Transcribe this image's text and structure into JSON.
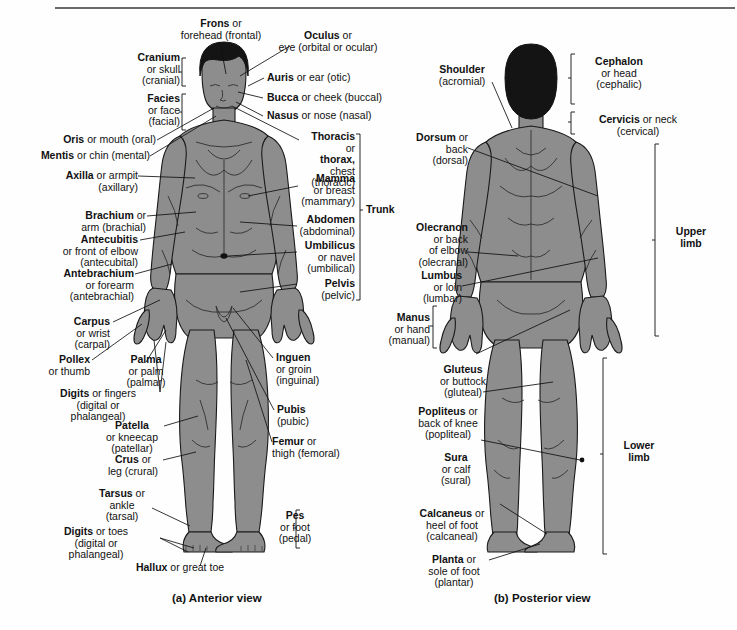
{
  "figure": {
    "caption_a": "(a) Anterior view",
    "caption_b": "(b) Posterior view",
    "body_color": "#8d8d8d",
    "hair_color": "#141414",
    "outline_color": "#1a1a1a",
    "background_color": "#fefefe"
  },
  "anterior": {
    "labels": [
      {
        "id": "frons",
        "term": "Frons",
        "rest": " or\nforehead (frontal)"
      },
      {
        "id": "oculus",
        "term": "Oculus",
        "rest": " or\neye (orbital or ocular)"
      },
      {
        "id": "cranium",
        "term": "Cranium",
        "rest": "\nor skull\n(cranial)"
      },
      {
        "id": "auris",
        "term": "Auris",
        "rest": " or ear (otic)"
      },
      {
        "id": "facies",
        "term": "Facies",
        "rest": "\nor face\n(facial)"
      },
      {
        "id": "bucca",
        "term": "Bucca",
        "rest": " or cheek (buccal)"
      },
      {
        "id": "nasus",
        "term": "Nasus",
        "rest": " or nose (nasal)"
      },
      {
        "id": "oris",
        "term": "Oris",
        "rest": " or mouth (oral)"
      },
      {
        "id": "thoracis",
        "term": "Thoracis",
        "rest": " or\nthorax, chest\n(thoracic)",
        "term2": "thorax,"
      },
      {
        "id": "mentis",
        "term": "Mentis",
        "rest": " or chin (mental)"
      },
      {
        "id": "mamma",
        "term": "Mamma",
        "rest": "\nor breast\n(mammary)"
      },
      {
        "id": "axilla",
        "term": "Axilla",
        "rest": " or armpit\n(axillary)"
      },
      {
        "id": "abdomen",
        "term": "Abdomen",
        "rest": "\n(abdominal)"
      },
      {
        "id": "brachium",
        "term": "Brachium",
        "rest": " or\narm (brachial)"
      },
      {
        "id": "umbilicus",
        "term": "Umbilicus",
        "rest": "\nor navel\n(umbilical)"
      },
      {
        "id": "antecubitis",
        "term": "Antecubitis",
        "rest": "\nor front of elbow\n(antecubital)"
      },
      {
        "id": "pelvis",
        "term": "Pelvis",
        "rest": "\n(pelvic)"
      },
      {
        "id": "antebrachium",
        "term": "Antebrachium",
        "rest": "\nor forearm\n(antebrachial)"
      },
      {
        "id": "carpus",
        "term": "Carpus",
        "rest": "\nor wrist\n(carpal)"
      },
      {
        "id": "pollex",
        "term": "Pollex",
        "rest": "\nor thumb"
      },
      {
        "id": "palma",
        "term": "Palma",
        "rest": "\nor palm\n(palmar)"
      },
      {
        "id": "digits_hand",
        "term": "Digits",
        "rest": " or fingers\n(digital or\nphalangeal)"
      },
      {
        "id": "inguen",
        "term": "Inguen",
        "rest": "\nor groin\n(inguinal)"
      },
      {
        "id": "pubis",
        "term": "Pubis",
        "rest": "\n(pubic)"
      },
      {
        "id": "patella",
        "term": "Patella",
        "rest": "\nor kneecap\n(patellar)"
      },
      {
        "id": "femur",
        "term": "Femur",
        "rest": " or\nthigh (femoral)"
      },
      {
        "id": "crus",
        "term": "Crus",
        "rest": " or\nleg (crural)"
      },
      {
        "id": "tarsus",
        "term": "Tarsus",
        "rest": " or\nankle\n(tarsal)"
      },
      {
        "id": "digits_foot",
        "term": "Digits",
        "rest": " or toes\n(digital or\nphalangeal)"
      },
      {
        "id": "pes",
        "term": "Pes",
        "rest": "\nor foot\n(pedal)"
      },
      {
        "id": "hallux",
        "term": "Hallux",
        "rest": " or great toe"
      }
    ],
    "brackets": [
      {
        "id": "trunk",
        "label": "Trunk"
      }
    ]
  },
  "posterior": {
    "labels": [
      {
        "id": "cephalon",
        "term": "Cephalon",
        "rest": "\nor head\n(cephalic)"
      },
      {
        "id": "shoulder",
        "term": "Shoulder",
        "rest": "\n(acromial)"
      },
      {
        "id": "cervicis",
        "term": "Cervicis",
        "rest": " or neck\n(cervical)"
      },
      {
        "id": "dorsum",
        "term": "Dorsum",
        "rest": " or\nback\n(dorsal)"
      },
      {
        "id": "olecranon",
        "term": "Olecranon",
        "rest": "\nor back\nof elbow\n(olecranal)"
      },
      {
        "id": "lumbus",
        "term": "Lumbus",
        "rest": "\nor loin\n(lumbar)"
      },
      {
        "id": "manus",
        "term": "Manus",
        "rest": "\nor hand\n(manual)"
      },
      {
        "id": "gluteus",
        "term": "Gluteus",
        "rest": "\nor buttock\n(gluteal)"
      },
      {
        "id": "popliteus",
        "term": "Popliteus",
        "rest": " or\nback of knee\n(popliteal)"
      },
      {
        "id": "sura",
        "term": "Sura",
        "rest": "\nor calf\n(sural)"
      },
      {
        "id": "calcaneus",
        "term": "Calcaneus",
        "rest": " or\nheel of foot\n(calcaneal)"
      },
      {
        "id": "planta",
        "term": "Planta",
        "rest": " or\nsole of foot\n(plantar)"
      }
    ],
    "brackets": [
      {
        "id": "upper-limb",
        "label": "Upper\nlimb"
      },
      {
        "id": "lower-limb",
        "label": "Lower\nlimb"
      }
    ]
  }
}
